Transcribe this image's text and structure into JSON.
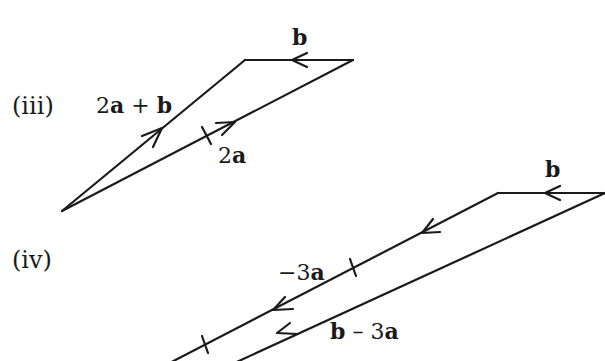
{
  "colors": {
    "stroke": "#1a1a1a",
    "background": "#ffffff"
  },
  "figure_iii": {
    "part_label": "(iii)",
    "vectors": [
      {
        "id": "sum",
        "label_num": "2",
        "label_a": "a",
        "label_op": " + ",
        "label_b": "b",
        "label": "2a + b"
      },
      {
        "id": "b",
        "label": "b"
      },
      {
        "id": "2a",
        "label_num": "2",
        "label_a": "a",
        "label": "2a"
      }
    ],
    "vertices": {
      "origin": [
        62,
        211
      ],
      "top_left": [
        245,
        60
      ],
      "top_right": [
        353,
        60
      ]
    }
  },
  "figure_iv": {
    "part_label": "(iv)",
    "vectors": [
      {
        "id": "b",
        "label": "b"
      },
      {
        "id": "neg3a",
        "label_num": "−3",
        "label_a": "a",
        "label": "−3a"
      },
      {
        "id": "diff",
        "label_b": "b",
        "label_op": " – ",
        "label_num": "3",
        "label_a": "a",
        "label": "b – 3a"
      }
    ],
    "vertices": {
      "top_left": [
        498,
        193
      ],
      "top_right": [
        605,
        193
      ]
    }
  }
}
